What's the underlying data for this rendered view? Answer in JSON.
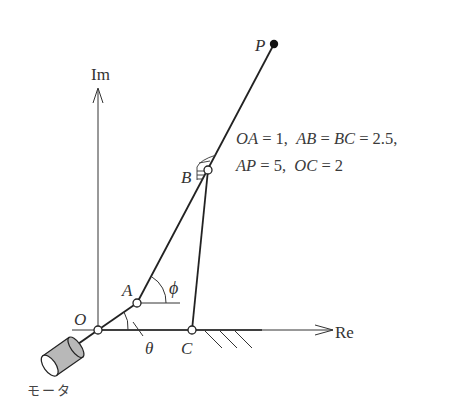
{
  "diagram": {
    "type": "four-bar linkage mechanism on complex plane",
    "axes": {
      "imaginary_label": "Im",
      "real_label": "Re"
    },
    "points": {
      "O": {
        "label": "O",
        "x": 98,
        "y": 330
      },
      "A": {
        "label": "A",
        "x": 137,
        "y": 303
      },
      "B": {
        "label": "B",
        "x": 208,
        "y": 170
      },
      "C": {
        "label": "C",
        "x": 192,
        "y": 330
      },
      "P": {
        "label": "P",
        "x": 274,
        "y": 44
      }
    },
    "angles": {
      "theta": "θ",
      "phi": "ϕ"
    },
    "motor_label": "モータ",
    "parameters": {
      "line1": [
        "OA",
        "=",
        "1,",
        "AB",
        "=",
        "BC",
        "=",
        "2.5,"
      ],
      "line2": [
        "AP",
        "=",
        "5,",
        "OC",
        "=",
        "2"
      ],
      "line1_text": "OA = 1,  AB = BC = 2.5,",
      "line2_text": "AP = 5,  OC = 2"
    },
    "colors": {
      "line": "#222222",
      "motor_fill": "#b8b8b8",
      "text": "#333333"
    }
  }
}
